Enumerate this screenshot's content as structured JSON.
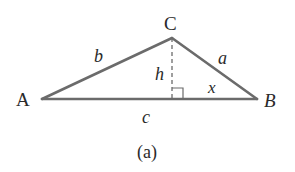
{
  "figure": {
    "caption": "(a)",
    "colors": {
      "stroke": "#6b6b6b",
      "text": "#2a2a2a",
      "background": "#ffffff"
    },
    "vertices": {
      "A": {
        "label": "A",
        "x": 42,
        "y": 99
      },
      "B": {
        "label": "B",
        "x": 257,
        "y": 99
      },
      "C": {
        "label": "C",
        "x": 172,
        "y": 38
      }
    },
    "sides": {
      "a": {
        "label": "a",
        "between": "B-C"
      },
      "b": {
        "label": "b",
        "between": "A-C"
      },
      "c": {
        "label": "c",
        "between": "A-B"
      }
    },
    "altitude": {
      "label": "h",
      "from": "C",
      "style": "dashed",
      "right_angle_marker": true
    },
    "segment": {
      "label": "x",
      "description": "segment from foot of altitude to B"
    }
  }
}
